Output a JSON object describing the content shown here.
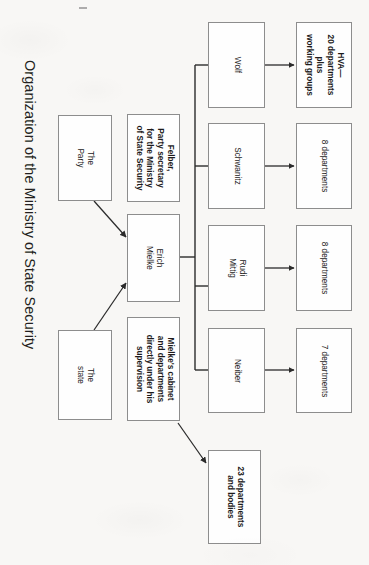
{
  "title": "Organization of the Ministry of State Security",
  "nodes": {
    "party": {
      "label": "The\nParty"
    },
    "state": {
      "label": "The\nstate"
    },
    "felber": {
      "label": "Felber,\nParty secretary\nfor the Ministry\nof State Security"
    },
    "mielke": {
      "label": "Erich\nMielke"
    },
    "cabinet": {
      "label": "Mielke's cabinet\nand departments\ndirectly under his\nsupervision"
    },
    "wolf": {
      "label": "Wolf"
    },
    "schwanitz": {
      "label": "Schwanitz"
    },
    "mittig": {
      "label": "Rudi\nMittig"
    },
    "neiber": {
      "label": "Neiber"
    },
    "hva": {
      "label": "HVA—\n20 departments\nplus\nworking groups"
    },
    "dept_schwanitz": {
      "label": "8 departments"
    },
    "dept_mittig": {
      "label": "8 departments"
    },
    "dept_neiber": {
      "label": "7 departments"
    },
    "bodies": {
      "label": "23 departments\nand bodies"
    }
  },
  "colors": {
    "background": "#f8f7f5",
    "box_fill": "#fefefe",
    "box_border": "#8d8d8d",
    "text": "#1c1a1b",
    "title_text": "#231f20",
    "connector": "#2b2b2b"
  }
}
